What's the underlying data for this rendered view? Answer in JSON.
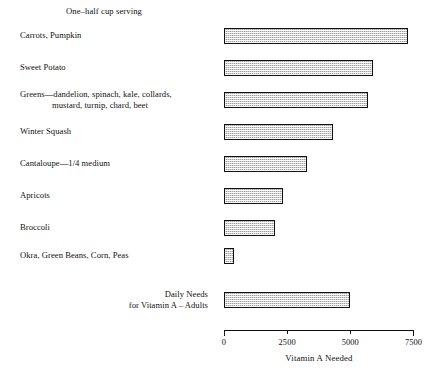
{
  "chart_data": {
    "type": "bar",
    "orientation": "horizontal",
    "title": "",
    "note": "One–half cup serving",
    "xlabel": "Vitamin A Needed",
    "ylabel": "",
    "xlim": [
      0,
      7500
    ],
    "xticks": [
      "0",
      "2500",
      "5000",
      "7500"
    ],
    "xtick_values": [
      0,
      2500,
      5000,
      7500
    ],
    "grid": false,
    "legend": "none",
    "categories": [
      "Carrots, Pumpkin",
      "Sweet Potato",
      "Greens—dandelion, spinach, kale, collards, mustard, turnip, chard, beet",
      "Winter Squash",
      "Cantaloupe—1/4 medium",
      "Apricots",
      "Broccoli",
      "Okra, Green Beans, Corn, Peas",
      "Daily Needs for Vitamin A – Adults"
    ],
    "values": [
      7300,
      5900,
      5700,
      4300,
      3300,
      2350,
      2000,
      400,
      5000
    ]
  },
  "rows": [
    {
      "name": "carrots-pumpkin",
      "label_line1": "Carrots, Pumpkin",
      "label_line2": "",
      "value": 7300
    },
    {
      "name": "sweet-potato",
      "label_line1": "Sweet Potato",
      "label_line2": "",
      "value": 5900
    },
    {
      "name": "greens",
      "label_line1": "Greens—dandelion, spinach, kale, collards,",
      "label_line2": "mustard, turnip, chard, beet",
      "value": 5700
    },
    {
      "name": "winter-squash",
      "label_line1": "Winter Squash",
      "label_line2": "",
      "value": 4300
    },
    {
      "name": "cantaloupe",
      "label_line1": "Cantaloupe—1/4 medium",
      "label_line2": "",
      "value": 3300
    },
    {
      "name": "apricots",
      "label_line1": "Apricots",
      "label_line2": "",
      "value": 2350
    },
    {
      "name": "broccoli",
      "label_line1": "Broccoli",
      "label_line2": "",
      "value": 2000
    },
    {
      "name": "okra-green-beans-corn-peas",
      "label_line1": "Okra, Green Beans, Corn, Peas",
      "label_line2": "",
      "value": 400
    },
    {
      "name": "daily-needs-vitamin-a-adults",
      "label_line1": "Daily Needs",
      "label_line2": "for Vitamin A – Adults",
      "value": 5000
    }
  ],
  "axis": {
    "ticks": [
      {
        "label": "0",
        "value": 0
      },
      {
        "label": "2500",
        "value": 2500
      },
      {
        "label": "5000",
        "value": 5000
      },
      {
        "label": "7500",
        "value": 7500
      }
    ],
    "title": "Vitamin A Needed"
  },
  "note": "One–half cup serving",
  "colors": {
    "bar_outline": "#111111",
    "bar_fill": "#d2d2d2",
    "text": "#111111",
    "axis": "#111111"
  }
}
